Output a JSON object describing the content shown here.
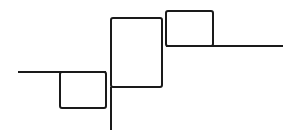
{
  "diagram": {
    "stroke_color": "#1a1a1a",
    "background": "#ffffff",
    "stroke_width": 2,
    "elements": [
      {
        "type": "line",
        "name": "left-baseline",
        "x1": 18,
        "y1": 72,
        "x2": 106,
        "y2": 72
      },
      {
        "type": "rect",
        "name": "box-low",
        "x": 60,
        "y": 72,
        "w": 46,
        "h": 36
      },
      {
        "type": "line",
        "name": "center-vertical",
        "x1": 111,
        "y1": 87,
        "x2": 111,
        "y2": 130
      },
      {
        "type": "rect",
        "name": "box-tall",
        "x": 111,
        "y": 18,
        "w": 51,
        "h": 69
      },
      {
        "type": "rect",
        "name": "box-high",
        "x": 166,
        "y": 11,
        "w": 47,
        "h": 35
      },
      {
        "type": "line",
        "name": "right-baseline",
        "x1": 166,
        "y1": 46,
        "x2": 283,
        "y2": 46
      }
    ]
  }
}
